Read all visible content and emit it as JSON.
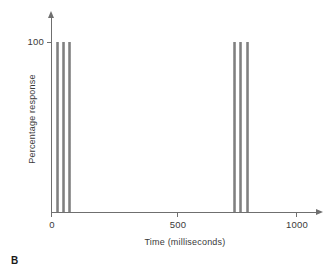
{
  "panel": {
    "label": "B"
  },
  "axes": {
    "x_title": "Time (milliseconds)",
    "y_title": "Percentage response",
    "x_ticks": [
      "0",
      "500",
      "1000"
    ],
    "y_ticks": [
      "100"
    ]
  },
  "colors": {
    "bar": "#808080",
    "axis": "#6f6f6f",
    "text": "#3a3a3a",
    "background": "#ffffff"
  },
  "chart_data": {
    "type": "bar",
    "title": "",
    "subtitle": "",
    "xlabel": "Time (milliseconds)",
    "ylabel": "Percentage response",
    "xlim": [
      0,
      1050
    ],
    "ylim": [
      0,
      108
    ],
    "xticks": [
      0,
      500,
      1000
    ],
    "yticks": [
      100
    ],
    "grid": false,
    "legend": null,
    "annotations": [
      "B"
    ],
    "series": [
      {
        "name": "Percentage response",
        "x": [
          25,
          50,
          75,
          750,
          775,
          800
        ],
        "values": [
          100,
          100,
          100,
          100,
          100,
          100
        ]
      }
    ],
    "groups": [
      {
        "name": "first-burst",
        "x": [
          25,
          50,
          75
        ],
        "values": [
          100,
          100,
          100
        ]
      },
      {
        "name": "second-burst",
        "x": [
          750,
          775,
          800
        ],
        "values": [
          100,
          100,
          100
        ]
      }
    ]
  }
}
